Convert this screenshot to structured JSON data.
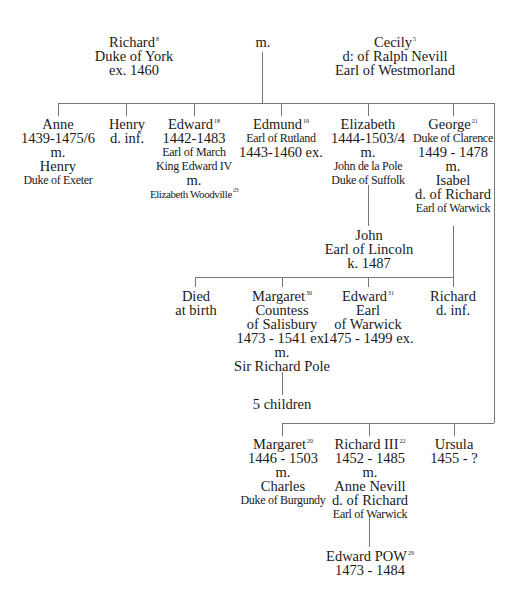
{
  "parents": {
    "father": {
      "name": "Richard",
      "note": "8",
      "line2": "Duke of York",
      "line3": "ex. 1460"
    },
    "marriage": "m.",
    "mother": {
      "name": "Cecily",
      "note": "5",
      "line2": "d: of Ralph Nevill",
      "line3": "Earl of Westmorland"
    }
  },
  "children_row1": [
    {
      "name": "Anne",
      "dates": "1439-1475/6",
      "m": "m.",
      "spouse": "Henry",
      "spouse_title": "Duke of Exeter"
    },
    {
      "name": "Henry",
      "dates": "d. inf."
    },
    {
      "name": "Edward",
      "note": "18",
      "dates": "1442-1483",
      "title": "Earl of March",
      "title2": "King Edward IV",
      "m": "m.",
      "spouse": "Elizabeth Woodville",
      "spouse_note": "23"
    },
    {
      "name": "Edmund",
      "note": "19",
      "title": "Earl of Rutland",
      "dates": "1443-1460 ex."
    },
    {
      "name": "Elizabeth",
      "dates": "1444-1503/4",
      "m": "m.",
      "spouse": "John de la Pole",
      "spouse_title": "Duke of Suffolk"
    },
    {
      "name": "George",
      "note": "21",
      "title": "Duke of Clarence",
      "dates": "1449 - 1478",
      "m": "m.",
      "spouse": "Isabel",
      "spouse_line2": "d. of Richard",
      "spouse_title": "Earl of Warwick"
    }
  ],
  "john": {
    "name": "John",
    "title": "Earl of Lincoln",
    "dates": "k. 1487"
  },
  "george_children": [
    {
      "name": "Died",
      "line2": "at birth"
    },
    {
      "name": "Margaret",
      "note": "30",
      "title": "Countess",
      "title2": "of Salisbury",
      "dates": "1473 - 1541 ex.",
      "m": "m.",
      "spouse": "Sir Richard Pole"
    },
    {
      "name": "Edward",
      "note": "31",
      "title": "Earl",
      "title2": "of Warwick",
      "dates": "1475 - 1499 ex."
    },
    {
      "name": "Richard",
      "dates": "d. inf."
    }
  ],
  "pole_children": "5 children",
  "children_row2": [
    {
      "name": "Margaret",
      "note": "20",
      "dates": "1446 - 1503",
      "m": "m.",
      "spouse": "Charles",
      "spouse_title": "Duke of Burgundy"
    },
    {
      "name": "Richard III",
      "note": "22",
      "dates": "1452 - 1485",
      "m": "m.",
      "spouse": "Anne Nevill",
      "spouse_line2": "d. of Richard",
      "spouse_title": "Earl of Warwick"
    },
    {
      "name": "Ursula",
      "dates": "1455 - ?"
    }
  ],
  "edward_pow": {
    "name": "Edward POW",
    "note": "29",
    "dates": "1473 - 1484"
  }
}
